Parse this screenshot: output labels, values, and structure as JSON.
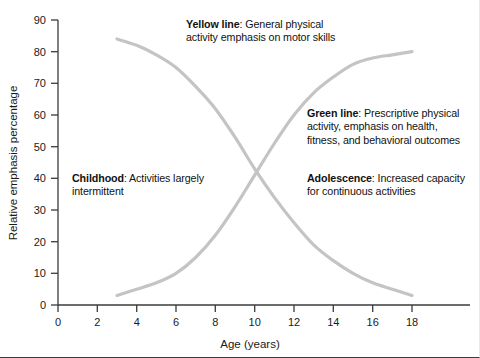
{
  "chart_data": {
    "type": "line",
    "title": "",
    "xlabel": "Age (years)",
    "ylabel": "Relative emphasis percentage",
    "xlim": [
      0,
      19.5
    ],
    "ylim": [
      0,
      90
    ],
    "xticks": [
      0,
      2,
      4,
      6,
      8,
      10,
      12,
      14,
      16,
      18
    ],
    "yticks": [
      0,
      10,
      20,
      30,
      40,
      50,
      60,
      70,
      80,
      90
    ],
    "grid": false,
    "legend": "none",
    "series": [
      {
        "name": "Yellow line",
        "color": "#c4c4c4",
        "x": [
          3,
          4,
          5,
          6,
          7,
          8,
          9,
          10,
          11,
          12,
          13,
          14,
          15,
          16,
          17,
          18
        ],
        "values": [
          84,
          82,
          79,
          75,
          69,
          62,
          53,
          43,
          34,
          26,
          19,
          14,
          10,
          7,
          5,
          3
        ]
      },
      {
        "name": "Green line",
        "color": "#c4c4c4",
        "x": [
          3,
          4,
          5,
          6,
          7,
          8,
          9,
          10,
          11,
          12,
          13,
          14,
          15,
          16,
          17,
          18
        ],
        "values": [
          3,
          5,
          7,
          10,
          15,
          22,
          31,
          41,
          51,
          60,
          67,
          72,
          76,
          78,
          79,
          80
        ]
      }
    ],
    "annotations": [
      {
        "id": "yellow",
        "bold": "Yellow line",
        "text": ": General physical activity emphasis on motor skills"
      },
      {
        "id": "green",
        "bold": "Green line",
        "text": ": Prescriptive physical activity, emphasis on health, fitness, and behavioral outcomes"
      },
      {
        "id": "childhood",
        "bold": "Childhood",
        "text": ": Activities largely intermittent"
      },
      {
        "id": "adolescence",
        "bold": "Adolescence",
        "text": ": Increased capacity for continuous activities"
      }
    ]
  },
  "axes": {
    "x_title": "Age (years)",
    "y_title": "Relative emphasis percentage",
    "x_tick_labels": [
      "0",
      "2",
      "4",
      "6",
      "8",
      "10",
      "12",
      "14",
      "16",
      "18"
    ],
    "y_tick_labels": [
      "0",
      "10",
      "20",
      "30",
      "40",
      "50",
      "60",
      "70",
      "80",
      "90"
    ]
  },
  "annotations": {
    "yellow": {
      "bold": "Yellow line",
      "rest": ": General physical activity emphasis on motor skills"
    },
    "green": {
      "bold": "Green line",
      "rest": ": Prescriptive physical activity, emphasis on health, fitness, and behavioral outcomes"
    },
    "childhood": {
      "bold": "Childhood",
      "rest": ": Activities largely intermittent"
    },
    "adolescence": {
      "bold": "Adolescence",
      "rest": ": Increased capacity for continuous activities"
    }
  },
  "colors": {
    "line": "#c4c4c4",
    "axis": "#3b3b3b",
    "text": "#111111",
    "background": "#ffffff"
  }
}
